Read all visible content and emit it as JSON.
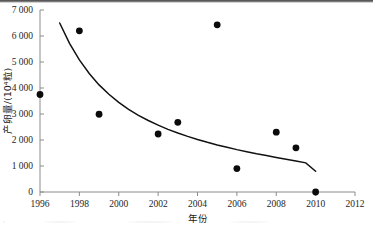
{
  "chart_data": {
    "type": "scatter",
    "title": "",
    "subtitle": "",
    "xlabel": "年份",
    "ylabel": "产卵量/(10⁴粒)",
    "xlim": [
      1996,
      2012
    ],
    "ylim": [
      0,
      7000
    ],
    "xticks": [
      1996,
      1998,
      2000,
      2002,
      2004,
      2006,
      2008,
      2010,
      2012
    ],
    "xticklabels": [
      "1996",
      "1998",
      "2000",
      "2002",
      "2004",
      "2006",
      "2008",
      "2010",
      "2012"
    ],
    "yticks": [
      0,
      1000,
      2000,
      3000,
      4000,
      5000,
      6000,
      7000
    ],
    "yticklabels": [
      "0",
      "1 000",
      "2 000",
      "3 000",
      "4 000",
      "5 000",
      "6 000",
      "7 000"
    ],
    "grid": false,
    "legend": null,
    "legend_position": "none",
    "series": [
      {
        "name": "产卵量",
        "type": "scatter",
        "marker": "filled-circle",
        "color": "#0b0b0b",
        "points": [
          {
            "x": 1996,
            "y": 3750
          },
          {
            "x": 1998,
            "y": 6200
          },
          {
            "x": 1999,
            "y": 2990
          },
          {
            "x": 2002,
            "y": 2230
          },
          {
            "x": 2003,
            "y": 2680
          },
          {
            "x": 2005,
            "y": 6430
          },
          {
            "x": 2006,
            "y": 900
          },
          {
            "x": 2008,
            "y": 2300
          },
          {
            "x": 2009,
            "y": 1700
          },
          {
            "x": 2010,
            "y": 0
          }
        ]
      },
      {
        "name": "拟合曲线",
        "type": "line",
        "color": "#111111",
        "points": [
          {
            "x": 1997.0,
            "y": 6500
          },
          {
            "x": 1997.5,
            "y": 5720
          },
          {
            "x": 1998.0,
            "y": 5080
          },
          {
            "x": 1998.5,
            "y": 4560
          },
          {
            "x": 1999.0,
            "y": 4120
          },
          {
            "x": 1999.5,
            "y": 3760
          },
          {
            "x": 2000.0,
            "y": 3450
          },
          {
            "x": 2000.5,
            "y": 3180
          },
          {
            "x": 2001.0,
            "y": 2950
          },
          {
            "x": 2001.5,
            "y": 2750
          },
          {
            "x": 2002.0,
            "y": 2570
          },
          {
            "x": 2002.5,
            "y": 2410
          },
          {
            "x": 2003.0,
            "y": 2270
          },
          {
            "x": 2003.5,
            "y": 2140
          },
          {
            "x": 2004.0,
            "y": 2020
          },
          {
            "x": 2004.5,
            "y": 1910
          },
          {
            "x": 2005.0,
            "y": 1810
          },
          {
            "x": 2005.5,
            "y": 1720
          },
          {
            "x": 2006.0,
            "y": 1630
          },
          {
            "x": 2006.5,
            "y": 1550
          },
          {
            "x": 2007.0,
            "y": 1470
          },
          {
            "x": 2007.5,
            "y": 1400
          },
          {
            "x": 2008.0,
            "y": 1330
          },
          {
            "x": 2008.5,
            "y": 1260
          },
          {
            "x": 2009.0,
            "y": 1190
          },
          {
            "x": 2009.5,
            "y": 1120
          },
          {
            "x": 2010.0,
            "y": 800
          }
        ]
      }
    ]
  }
}
